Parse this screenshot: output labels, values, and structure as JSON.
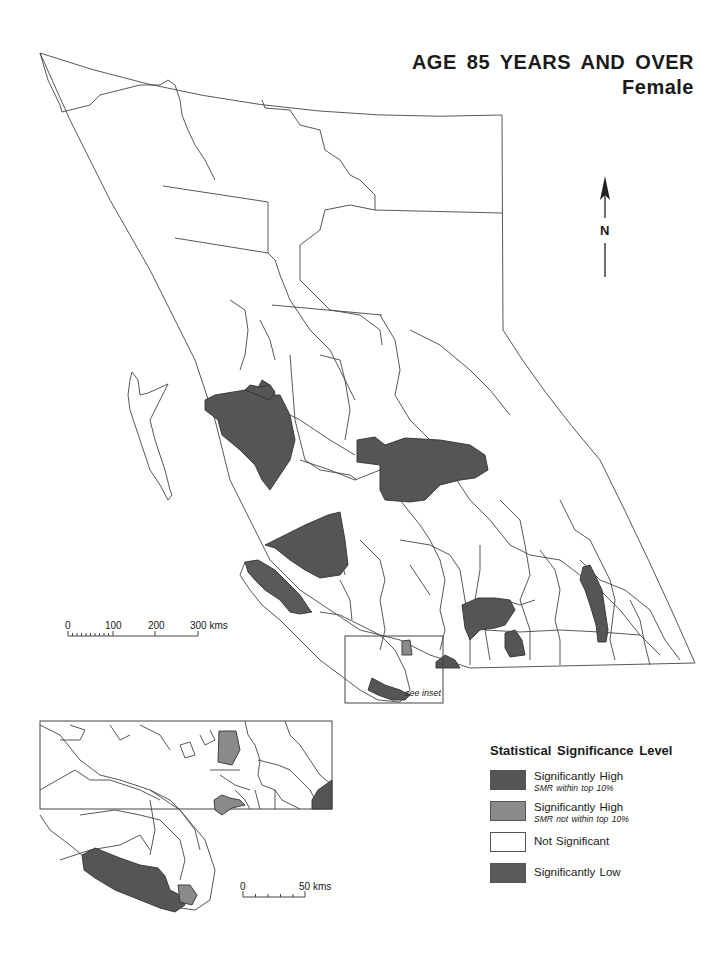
{
  "title": {
    "line1": "AGE 85 YEARS AND OVER",
    "line2": "Female"
  },
  "north_arrow": {
    "label": "N"
  },
  "main_scale": {
    "ticks": [
      "0",
      "100",
      "200",
      "300 kms"
    ]
  },
  "inset_scale": {
    "ticks": [
      "0",
      "50 kms"
    ]
  },
  "inset_box_label": "see inset",
  "legend": {
    "title": "Statistical Significance Level",
    "items": [
      {
        "label": "Significantly High",
        "sub": "SMR within top 10%",
        "color": "#555555"
      },
      {
        "label": "Significantly High",
        "sub": "SMR not within top 10%",
        "color": "#8a8a8a"
      },
      {
        "label": "Not Significant",
        "sub": "",
        "color": "#ffffff"
      },
      {
        "label": "Significantly Low",
        "sub": "",
        "color": "#5a5a5a"
      }
    ]
  },
  "colors": {
    "significant_high_top10": "#555555",
    "significant_high_not_top10": "#8a8a8a",
    "not_significant": "#ffffff",
    "significant_low": "#5a5a5a",
    "boundary": "#444444"
  }
}
